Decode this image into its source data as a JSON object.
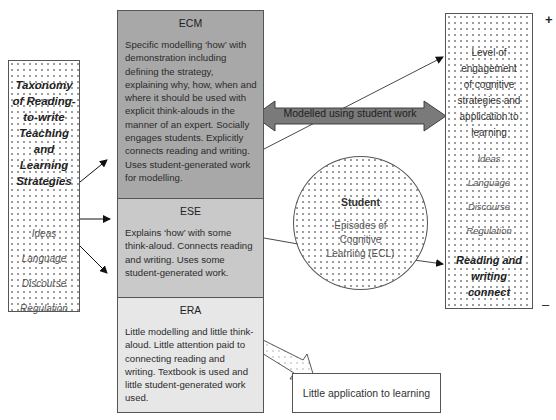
{
  "left_box": {
    "title_lines": [
      "Taxonomy",
      "of Reading-",
      "to-write",
      "Teaching",
      "and",
      "Learning",
      "Strategies"
    ],
    "items": [
      "Ideas",
      "Language",
      "Discourse",
      "Regulation"
    ]
  },
  "tiers": {
    "ecm": {
      "title": "ECM",
      "text": "Specific modelling ‘how’ with demonstration including defining the strategy, explaining why, how, when and where it should be used with explicit think-alouds in the manner of an expert. Socially engages students. Explicitly connects reading and writing. Uses student-generated work for modelling.",
      "fill": "#a8a8a8"
    },
    "ese": {
      "title": "ESE",
      "text": "Explains ‘how’ with some think-aloud. Connects reading and writing. Uses some student-generated work.",
      "fill": "#c9c9c9"
    },
    "era": {
      "title": "ERA",
      "text": "Little modelling and little think-aloud. Little attention paid to connecting reading and writing. Textbook is used and little student-generated work used.",
      "fill": "#e7e7e7"
    }
  },
  "double_arrow": {
    "label": "Modelled using student work",
    "fill": "#7a7a7a"
  },
  "student_circle": {
    "title": "Student",
    "subtitle_lines": [
      "Episodes of",
      "Cognitive",
      "Learning (ECL)"
    ]
  },
  "right_box": {
    "title_lines": [
      "Level of",
      "engagement",
      "of cognitive",
      "strategies and",
      "application to",
      "learning"
    ],
    "items": [
      "Ideas",
      "Language",
      "Discourse",
      "Regulation"
    ],
    "connect_lines": [
      "Reading and",
      "writing",
      "connect"
    ]
  },
  "little_application_box": {
    "label": "Little application to learning"
  },
  "scale": {
    "top_symbol": "+",
    "bottom_symbol": "–"
  }
}
